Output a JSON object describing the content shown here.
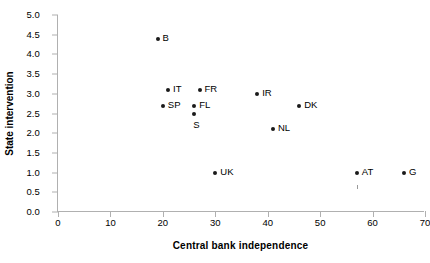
{
  "chart_data": {
    "type": "scatter",
    "title": "",
    "xlabel": "Central bank independence",
    "ylabel": "State intervention",
    "xlim": [
      0,
      70
    ],
    "ylim": [
      0,
      5.0
    ],
    "xticks": [
      "0",
      "10",
      "20",
      "30",
      "40",
      "50",
      "60",
      "70"
    ],
    "xtick_values": [
      0,
      10,
      20,
      30,
      40,
      50,
      60,
      70
    ],
    "yticks": [
      "0.0",
      "0.5",
      "1.0",
      "1.5",
      "2.0",
      "2.5",
      "3.0",
      "3.5",
      "4.0",
      "4.5",
      "5.0"
    ],
    "ytick_values": [
      0.0,
      0.5,
      1.0,
      1.5,
      2.0,
      2.5,
      3.0,
      3.5,
      4.0,
      4.5,
      5.0
    ],
    "grid": false,
    "legend": false,
    "points": [
      {
        "label": "B",
        "x": 19,
        "y": 4.4,
        "label_pos": "right"
      },
      {
        "label": "IT",
        "x": 21,
        "y": 3.1,
        "label_pos": "right"
      },
      {
        "label": "FR",
        "x": 27,
        "y": 3.1,
        "label_pos": "right"
      },
      {
        "label": "SP",
        "x": 20,
        "y": 2.7,
        "label_pos": "right"
      },
      {
        "label": "FL",
        "x": 26,
        "y": 2.7,
        "label_pos": "right"
      },
      {
        "label": "S",
        "x": 26,
        "y": 2.5,
        "label_pos": "below"
      },
      {
        "label": "IR",
        "x": 38,
        "y": 3.0,
        "label_pos": "right"
      },
      {
        "label": "DK",
        "x": 46,
        "y": 2.7,
        "label_pos": "right"
      },
      {
        "label": "NL",
        "x": 41,
        "y": 2.1,
        "label_pos": "right"
      },
      {
        "label": "UK",
        "x": 30,
        "y": 1.0,
        "label_pos": "right"
      },
      {
        "label": "AT",
        "x": 57,
        "y": 1.0,
        "label_pos": "right"
      },
      {
        "label": "G",
        "x": 66,
        "y": 1.0,
        "label_pos": "right"
      }
    ],
    "marker_color": "#1a1a1a",
    "axis_color": "#b0b0b0"
  }
}
